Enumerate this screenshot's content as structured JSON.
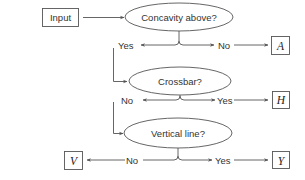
{
  "diagram": {
    "type": "decision-tree",
    "input": {
      "label": "Input"
    },
    "decisions": [
      {
        "id": "q1",
        "question": "Concavity above?",
        "yes_label": "Yes",
        "no_label": "No",
        "no_result": "A"
      },
      {
        "id": "q2",
        "question": "Crossbar?",
        "no_label": "No",
        "yes_label": "Yes",
        "yes_result": "H"
      },
      {
        "id": "q3",
        "question": "Vertical line?",
        "no_label": "No",
        "yes_label": "Yes",
        "no_result": "V",
        "yes_result": "Y"
      }
    ],
    "results": {
      "A": "A",
      "H": "H",
      "V": "V",
      "Y": "Y"
    },
    "colors": {
      "stroke": "#555555",
      "text": "#333333",
      "background": "#ffffff"
    }
  }
}
